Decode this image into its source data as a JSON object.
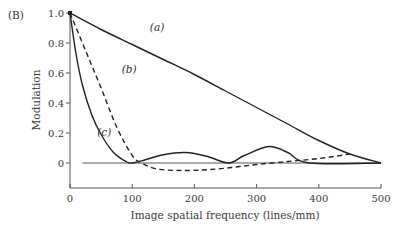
{
  "panel_label": "(B)",
  "chart_data": {
    "type": "line",
    "title": "",
    "xlabel": "Image spatial frequency (lines/mm)",
    "ylabel": "Modulation",
    "xlim": [
      0,
      500
    ],
    "ylim": [
      -0.15,
      1.0
    ],
    "xticks": [
      0,
      100,
      200,
      300,
      400,
      500
    ],
    "yticks": [
      0,
      0.2,
      0.4,
      0.6,
      0.8,
      1.0
    ],
    "ytick_labels": [
      "0",
      "0.2",
      "0.4",
      "0.6",
      "0.8",
      "1.0"
    ],
    "grid": false,
    "zero_line": {
      "from_x": 20,
      "to_x": 500,
      "y": 0
    },
    "series": [
      {
        "name": "(a)",
        "style": "solid",
        "x": [
          0,
          50,
          100,
          150,
          200,
          250,
          300,
          350,
          400,
          450,
          500
        ],
        "y": [
          1.0,
          0.89,
          0.79,
          0.69,
          0.59,
          0.48,
          0.37,
          0.26,
          0.15,
          0.06,
          0.0
        ]
      },
      {
        "name": "(b)",
        "style": "dashed",
        "x": [
          0,
          25,
          50,
          75,
          100,
          115,
          140,
          180,
          220,
          260,
          300,
          350,
          400,
          450
        ],
        "y": [
          1.0,
          0.75,
          0.5,
          0.24,
          0.05,
          0.0,
          -0.04,
          -0.05,
          -0.045,
          -0.03,
          -0.01,
          0.01,
          0.03,
          0.06
        ]
      },
      {
        "name": "(c)",
        "style": "solid",
        "x": [
          0,
          10,
          20,
          35,
          50,
          70,
          90,
          100,
          120,
          150,
          185,
          220,
          255,
          280,
          320,
          350,
          385,
          500
        ],
        "y": [
          1.0,
          0.72,
          0.52,
          0.32,
          0.19,
          0.07,
          0.01,
          0.0,
          0.02,
          0.055,
          0.07,
          0.045,
          0.0,
          0.05,
          0.11,
          0.07,
          0.0,
          0.0
        ]
      }
    ],
    "annotations": [
      {
        "text": "(a)",
        "x": 140,
        "y": 0.88
      },
      {
        "text": "(b)",
        "x": 95,
        "y": 0.6
      },
      {
        "text": "(c)",
        "x": 55,
        "y": 0.18
      }
    ]
  }
}
